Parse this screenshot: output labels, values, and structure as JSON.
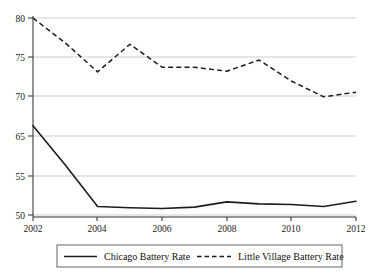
{
  "chart_data": {
    "type": "line",
    "title": "",
    "subtitle": "",
    "xlabel": "",
    "ylabel": "",
    "x": [
      2002,
      2003,
      2004,
      2005,
      2006,
      2007,
      2008,
      2009,
      2010,
      2011,
      2012
    ],
    "xlim": [
      2002,
      2012
    ],
    "ylim": [
      50,
      80
    ],
    "grid": true,
    "grid_axis": "y",
    "legend_position": "bottom",
    "y_tick_values": [
      50,
      55,
      65,
      70,
      75,
      80
    ],
    "y_tick_labels": [
      "50",
      "55",
      "65",
      "70",
      "75",
      "80"
    ],
    "x_tick_values": [
      2002,
      2004,
      2006,
      2008,
      2010,
      2012
    ],
    "x_tick_labels": [
      "2002",
      "2004",
      "2006",
      "2008",
      "2010",
      "2012"
    ],
    "series": [
      {
        "name": "Chicago Battery Rate",
        "style": "solid",
        "color": "#1c1c1c",
        "values": [
          63.6,
          57.6,
          51.3,
          51.1,
          51.0,
          51.2,
          52.0,
          51.7,
          51.6,
          51.3,
          52.1
        ]
      },
      {
        "name": "Little Village Battery Rate",
        "style": "dashed",
        "color": "#1c1c1c",
        "values": [
          80.0,
          76.2,
          71.8,
          76.0,
          72.5,
          72.5,
          71.9,
          73.6,
          70.4,
          68.0,
          68.7
        ]
      }
    ]
  },
  "legend": {
    "entries": [
      {
        "label": "Chicago Battery Rate",
        "style": "solid"
      },
      {
        "label": "Little Village Battery Rate",
        "style": "dashed"
      }
    ]
  },
  "axes": {
    "y_labels": [
      "80",
      "75",
      "70",
      "65",
      "55",
      "50"
    ],
    "x_labels": [
      "2002",
      "2004",
      "2006",
      "2008",
      "2010",
      "2012"
    ]
  },
  "colors": {
    "line": "#1c1c1c",
    "grid": "#b9b9b9",
    "axis": "#2a2a2a",
    "legend_border": "#555555",
    "background": "#ffffff"
  }
}
